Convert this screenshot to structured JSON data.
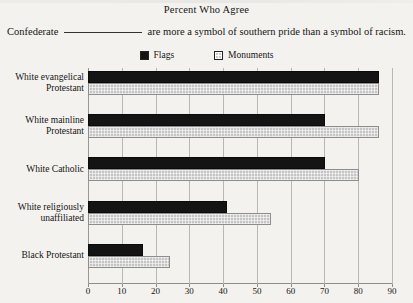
{
  "title": "Percent Who Agree",
  "subtitle": {
    "before": "Confederate",
    "blank": "",
    "after": "are more a symbol of southern pride than a symbol of racism."
  },
  "legend": {
    "position": "top-center",
    "items": [
      {
        "label": "Flags",
        "color": "#141414",
        "icon": "filled-square-icon"
      },
      {
        "label": "Monuments",
        "color": "#c5c5c5",
        "icon": "hatched-square-icon"
      }
    ]
  },
  "chart_data": {
    "type": "bar",
    "orientation": "horizontal",
    "title": "Percent Who Agree",
    "subtitle": "Confederate ______ are more a symbol of southern pride than a symbol of racism.",
    "xlabel": "",
    "ylabel": "",
    "xlim": [
      0,
      90
    ],
    "xticks": [
      0,
      10,
      20,
      30,
      40,
      50,
      60,
      70,
      80,
      90
    ],
    "grid": true,
    "categories": [
      "White evangelical Protestant",
      "White mainline Protestant",
      "White Catholic",
      "White religiously unaffiliated",
      "Black Protestant"
    ],
    "category_lines": [
      [
        "White evangelical",
        "Protestant"
      ],
      [
        "White mainline",
        "Protestant"
      ],
      [
        "White Catholic"
      ],
      [
        "White religiously",
        "unaffiliated"
      ],
      [
        "Black Protestant"
      ]
    ],
    "series": [
      {
        "name": "Flags",
        "color": "#141414",
        "values": [
          86,
          70,
          70,
          41,
          16
        ]
      },
      {
        "name": "Monuments",
        "color": "#c5c5c5",
        "values": [
          86,
          86,
          80,
          54,
          24
        ]
      }
    ]
  }
}
